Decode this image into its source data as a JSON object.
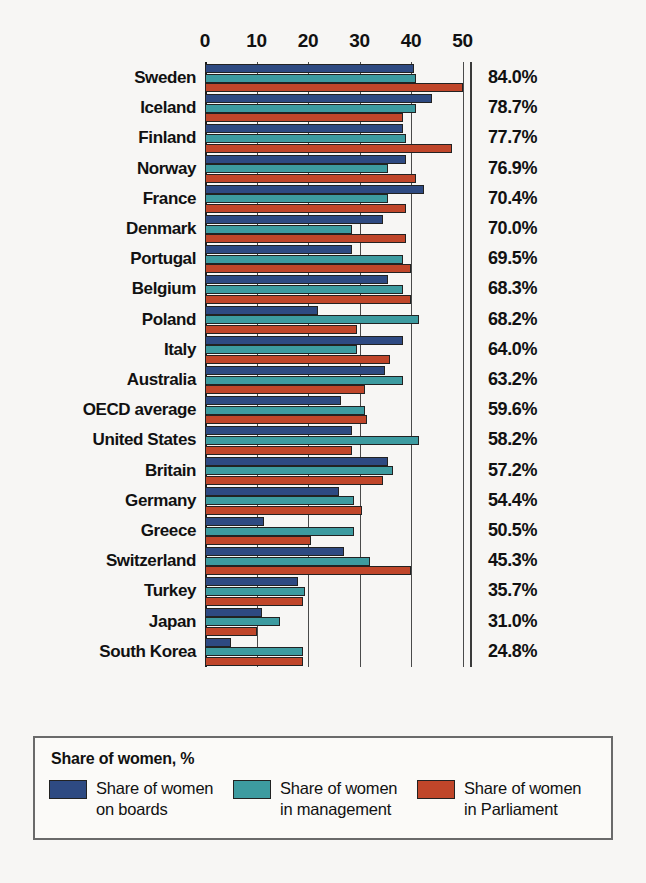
{
  "chart_data": {
    "type": "bar",
    "orientation": "horizontal",
    "title": "",
    "xlabel": "",
    "ylabel": "",
    "xlim": [
      0,
      50
    ],
    "xticks": [
      0,
      10,
      20,
      30,
      40,
      50
    ],
    "grid": true,
    "legend_position": "bottom",
    "legend_title": "Share of women, %",
    "categories": [
      "Sweden",
      "Iceland",
      "Finland",
      "Norway",
      "France",
      "Denmark",
      "Portugal",
      "Belgium",
      "Poland",
      "Italy",
      "Australia",
      "OECD average",
      "United States",
      "Britain",
      "Germany",
      "Greece",
      "Switzerland",
      "Turkey",
      "Japan",
      "South Korea"
    ],
    "series": [
      {
        "name": "Share of women on boards",
        "color": "#2e4a82",
        "values": [
          40.5,
          44.0,
          38.5,
          39.0,
          42.5,
          34.5,
          28.5,
          35.5,
          22.0,
          38.5,
          35.0,
          26.5,
          28.5,
          35.5,
          26.0,
          11.5,
          27.0,
          18.0,
          11.0,
          5.0
        ]
      },
      {
        "name": "Share of women in management",
        "color": "#3d9ba0",
        "values": [
          41.0,
          41.0,
          39.0,
          35.5,
          35.5,
          28.5,
          38.5,
          38.5,
          41.5,
          29.5,
          38.5,
          31.0,
          41.5,
          36.5,
          29.0,
          29.0,
          32.0,
          19.5,
          14.5,
          19.0
        ]
      },
      {
        "name": "Share of women in Parliament",
        "color": "#c0462a",
        "values": [
          50.0,
          38.5,
          48.0,
          41.0,
          39.0,
          39.0,
          40.0,
          40.0,
          29.5,
          36.0,
          31.0,
          31.5,
          28.5,
          34.5,
          30.5,
          20.5,
          40.0,
          19.0,
          10.0,
          19.0
        ]
      }
    ],
    "row_totals": [
      "84.0%",
      "78.7%",
      "77.7%",
      "76.9%",
      "70.4%",
      "70.0%",
      "69.5%",
      "68.3%",
      "68.2%",
      "64.0%",
      "63.2%",
      "59.6%",
      "58.2%",
      "57.2%",
      "54.4%",
      "50.5%",
      "45.3%",
      "35.7%",
      "31.0%",
      "24.8%"
    ]
  },
  "legend": {
    "title": "Share of women, %",
    "items": [
      {
        "label": "Share of women\non boards",
        "color": "#2e4a82"
      },
      {
        "label": "Share of women\nin management",
        "color": "#3d9ba0"
      },
      {
        "label": "Share of women\nin Parliament",
        "color": "#c0462a"
      }
    ]
  }
}
